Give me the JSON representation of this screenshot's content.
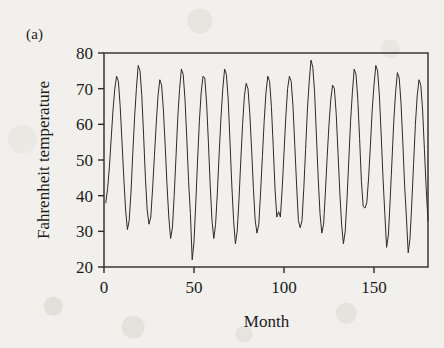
{
  "figure": {
    "panel_label": "(a)",
    "background_color": "#f2f0ec",
    "ink_color": "#2b2b2b"
  },
  "chart_data": {
    "type": "line",
    "title": "",
    "subtitle": "",
    "xlabel": "Month",
    "ylabel": "Fahrenheit temperature",
    "xlim": [
      0,
      180
    ],
    "ylim": [
      20,
      80
    ],
    "xticks": [
      0,
      50,
      100,
      150
    ],
    "xtick_labels": [
      "0",
      "50",
      "100",
      "150"
    ],
    "yticks": [
      20,
      30,
      40,
      50,
      60,
      70,
      80
    ],
    "ytick_labels": [
      "20",
      "30",
      "40",
      "50",
      "60",
      "70",
      "80"
    ],
    "grid": false,
    "legend": null,
    "annotations": [
      "(a)"
    ],
    "series": [
      {
        "name": "Fahrenheit temperature",
        "color": "#2b2b2b",
        "line_width": 1,
        "x": [
          1,
          2,
          3,
          4,
          5,
          6,
          7,
          8,
          9,
          10,
          11,
          12,
          13,
          14,
          15,
          16,
          17,
          18,
          19,
          20,
          21,
          22,
          23,
          24,
          25,
          26,
          27,
          28,
          29,
          30,
          31,
          32,
          33,
          34,
          35,
          36,
          37,
          38,
          39,
          40,
          41,
          42,
          43,
          44,
          45,
          46,
          47,
          48,
          49,
          50,
          51,
          52,
          53,
          54,
          55,
          56,
          57,
          58,
          59,
          60,
          61,
          62,
          63,
          64,
          65,
          66,
          67,
          68,
          69,
          70,
          71,
          72,
          73,
          74,
          75,
          76,
          77,
          78,
          79,
          80,
          81,
          82,
          83,
          84,
          85,
          86,
          87,
          88,
          89,
          90,
          91,
          92,
          93,
          94,
          95,
          96,
          97,
          98,
          99,
          100,
          101,
          102,
          103,
          104,
          105,
          106,
          107,
          108,
          109,
          110,
          111,
          112,
          113,
          114,
          115,
          116,
          117,
          118,
          119,
          120,
          121,
          122,
          123,
          124,
          125,
          126,
          127,
          128,
          129,
          130,
          131,
          132,
          133,
          134,
          135,
          136,
          137,
          138,
          139,
          140,
          141,
          142,
          143,
          144,
          145,
          146,
          147,
          148,
          149,
          150,
          151,
          152,
          153,
          154,
          155,
          156,
          157,
          158,
          159,
          160,
          161,
          162,
          163,
          164,
          165,
          166,
          167,
          168,
          169,
          170,
          171,
          172,
          173,
          174,
          175,
          176,
          177,
          178,
          179,
          180
        ],
        "values": [
          38,
          42,
          48,
          56,
          64,
          70,
          73.5,
          72,
          65,
          55,
          45,
          36,
          30.5,
          33,
          41,
          52,
          62,
          70,
          76.5,
          75,
          68,
          57,
          45,
          36,
          32,
          34,
          42,
          51,
          60,
          68,
          72.5,
          71,
          64,
          54,
          43,
          34,
          28,
          31,
          40,
          51,
          62,
          70,
          75.5,
          74,
          67,
          56,
          44,
          35,
          22,
          27,
          38,
          50,
          61,
          69,
          73.5,
          73,
          66,
          55,
          43,
          33,
          28,
          32,
          41,
          52,
          62,
          70,
          75.5,
          74,
          67,
          55,
          43,
          33,
          26.5,
          30,
          39,
          50,
          60,
          68,
          71.5,
          70,
          63,
          53,
          42,
          33,
          29.5,
          32,
          41,
          51,
          61,
          69,
          73.5,
          72,
          65,
          54,
          42,
          34,
          35.5,
          34,
          42,
          52,
          62,
          70,
          73.5,
          72,
          65,
          54,
          43,
          33,
          31,
          33,
          42,
          53,
          64,
          72,
          78,
          76,
          69,
          57,
          45,
          35,
          29.5,
          32,
          41,
          51,
          60,
          67,
          71,
          70,
          63,
          52,
          41,
          32,
          26.5,
          30,
          39,
          50,
          61,
          69,
          75.5,
          74,
          67,
          56,
          44,
          37,
          36.5,
          38,
          45,
          54,
          64,
          71,
          76.5,
          75,
          68,
          57,
          45,
          35,
          25.5,
          29,
          39,
          50,
          61,
          69,
          74.5,
          73,
          66,
          55,
          43,
          34,
          24,
          28,
          38,
          49,
          60,
          68,
          72.5,
          71,
          64,
          53,
          42,
          33
        ]
      }
    ]
  }
}
